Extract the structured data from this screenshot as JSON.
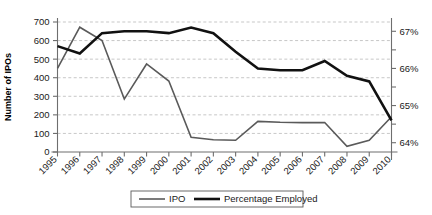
{
  "chart_data": {
    "type": "line",
    "title": "",
    "xlabel": "",
    "ylabel": "Number of IPOs",
    "y2label": "",
    "grid": true,
    "legend_position": "bottom-center",
    "categories": [
      "1995",
      "1996",
      "1997",
      "1998",
      "1999",
      "2000",
      "2001",
      "2002",
      "2003",
      "2004",
      "2005",
      "2006",
      "2007",
      "2008",
      "2009",
      "2010"
    ],
    "x": [
      1995,
      1996,
      1997,
      1998,
      1999,
      2000,
      2001,
      2002,
      2003,
      2004,
      2005,
      2006,
      2007,
      2008,
      2009,
      2010
    ],
    "ylim": [
      0,
      700
    ],
    "yticks": [
      0,
      100,
      200,
      300,
      400,
      500,
      600,
      700
    ],
    "yticklabels": [
      "0",
      "100",
      "200",
      "300",
      "400",
      "500",
      "600",
      "700"
    ],
    "y2lim": [
      63.75,
      67.25
    ],
    "y2ticks": [
      64,
      64.5,
      65,
      65.5,
      66,
      66.5,
      67
    ],
    "y2ticklabels": [
      "64%",
      "",
      "65%",
      "",
      "66%",
      "",
      "67%"
    ],
    "y2majorlabels": [
      "64%",
      "65%",
      "66%",
      "67%"
    ],
    "series": [
      {
        "name": "IPO",
        "axis": "left",
        "color": "#5a5a5a",
        "values": [
          450,
          672,
          600,
          285,
          474,
          382,
          79,
          66,
          63,
          165,
          160,
          158,
          159,
          31,
          63,
          190
        ]
      },
      {
        "name": "Percentage Employed",
        "axis": "right",
        "color": "#111111",
        "values": [
          66.6,
          66.4,
          66.95,
          67.0,
          67.0,
          66.95,
          67.1,
          66.95,
          66.45,
          66.0,
          65.95,
          65.95,
          66.2,
          65.8,
          65.65,
          64.6
        ]
      }
    ]
  },
  "legend": {
    "items": [
      {
        "label": "IPO"
      },
      {
        "label": "Percentage Employed"
      }
    ]
  },
  "axes": {
    "left_title": "Number of IPOs"
  }
}
